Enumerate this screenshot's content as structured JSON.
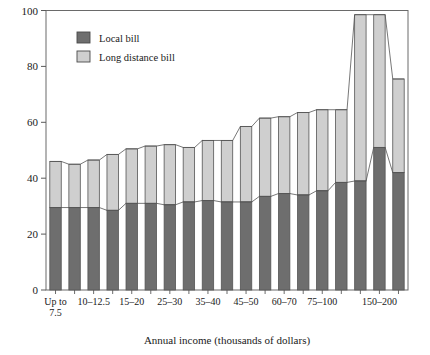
{
  "chart_data": {
    "type": "bar",
    "subtype": "stacked-bar-with-connecting-lines",
    "title": "",
    "xlabel": "Annual income (thousands of dollars)",
    "ylabel": "",
    "ylim": [
      0,
      100
    ],
    "yticks": [
      0,
      20,
      40,
      60,
      80,
      100
    ],
    "ytick_labels": [
      "0",
      "20",
      "40",
      "60",
      "80",
      "100"
    ],
    "grid": false,
    "legend_position": "top-left-inside",
    "categories": [
      "Up to 7.5",
      "7.5–10",
      "10–12.5",
      "12.5–15",
      "15–20",
      "20–25",
      "25–30",
      "30–35",
      "35–40",
      "40–45",
      "45–50",
      "50–60",
      "60–70",
      "70–75",
      "75–100",
      "100–125",
      "125–150",
      "150–200",
      "200+"
    ],
    "visible_xtick_labels": [
      {
        "index": 0,
        "label": "Up to\n7.5"
      },
      {
        "index": 2,
        "label": "10–12.5"
      },
      {
        "index": 4,
        "label": "15–20"
      },
      {
        "index": 6,
        "label": "25–30"
      },
      {
        "index": 8,
        "label": "35–40"
      },
      {
        "index": 10,
        "label": "45–50"
      },
      {
        "index": 12,
        "label": "60–70"
      },
      {
        "index": 14,
        "label": "75–100"
      },
      {
        "index": 17,
        "label": "150–200"
      }
    ],
    "series": [
      {
        "name": "Local bill",
        "color": "#6e6e6e",
        "values": [
          29.5,
          29.5,
          29.5,
          28.5,
          31.0,
          31.0,
          30.5,
          31.5,
          32.0,
          31.5,
          31.5,
          33.5,
          34.5,
          34.0,
          35.5,
          38.5,
          39.0,
          51.0,
          42.0
        ]
      },
      {
        "name": "Long distance bill",
        "color": "#cfcfcf",
        "values": [
          16.5,
          15.5,
          17.0,
          20.0,
          19.5,
          20.5,
          21.5,
          19.5,
          21.5,
          22.0,
          27.0,
          28.0,
          27.5,
          29.5,
          29.0,
          26.0,
          59.5,
          47.5,
          33.5
        ]
      }
    ],
    "totals": [
      46.0,
      45.0,
      46.5,
      48.5,
      50.5,
      51.5,
      52.0,
      51.0,
      53.5,
      53.5,
      58.5,
      61.5,
      62.0,
      63.5,
      64.5,
      64.5,
      98.5,
      98.5,
      75.5
    ]
  },
  "legend": {
    "items": [
      {
        "label": "Local bill",
        "swatch": "#6e6e6e"
      },
      {
        "label": "Long distance bill",
        "swatch": "#cfcfcf"
      }
    ]
  },
  "axes": {
    "x_title": "Annual income (thousands of dollars)",
    "y_tick_labels": [
      "100",
      "80",
      "60",
      "40",
      "20",
      "0"
    ]
  },
  "colors": {
    "local": "#6e6e6e",
    "long_distance": "#cfcfcf",
    "outline": "#555555",
    "axis": "#5a5a5a",
    "background": "#ffffff"
  }
}
